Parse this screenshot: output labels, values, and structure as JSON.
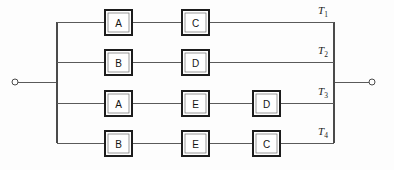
{
  "diagram": {
    "type": "block-diagram",
    "background_color": "#fdfdfd",
    "line_color": "#5a5a5a",
    "block_border_color": "#1c1c1c",
    "block_fill_color": "#ffffff",
    "terminals": {
      "left": {
        "name": "left-terminal",
        "cx": 15,
        "cy": 82,
        "r": 3
      },
      "right": {
        "name": "right-terminal",
        "cx": 372,
        "cy": 82,
        "r": 3
      }
    },
    "buses": {
      "left_x": 57,
      "right_x": 334,
      "top_y": 22,
      "bottom_y": 143
    },
    "paths": [
      {
        "id": "T1",
        "label": "T",
        "subscript": "1",
        "y": 22,
        "label_x": 318,
        "label_y": 14,
        "blocks": [
          {
            "text": "A",
            "x": 105,
            "width": 27,
            "height": 25
          },
          {
            "text": "C",
            "x": 182,
            "width": 27,
            "height": 25
          }
        ]
      },
      {
        "id": "T2",
        "label": "T",
        "subscript": "2",
        "y": 62,
        "label_x": 318,
        "label_y": 54,
        "blocks": [
          {
            "text": "B",
            "x": 105,
            "width": 27,
            "height": 25
          },
          {
            "text": "D",
            "x": 182,
            "width": 27,
            "height": 25
          }
        ]
      },
      {
        "id": "T3",
        "label": "T",
        "subscript": "3",
        "y": 103,
        "label_x": 318,
        "label_y": 95,
        "blocks": [
          {
            "text": "A",
            "x": 105,
            "width": 27,
            "height": 25
          },
          {
            "text": "E",
            "x": 182,
            "width": 27,
            "height": 25
          },
          {
            "text": "D",
            "x": 253,
            "width": 27,
            "height": 25
          }
        ]
      },
      {
        "id": "T4",
        "label": "T",
        "subscript": "4",
        "y": 143,
        "label_x": 318,
        "label_y": 135,
        "blocks": [
          {
            "text": "B",
            "x": 105,
            "width": 27,
            "height": 25
          },
          {
            "text": "E",
            "x": 182,
            "width": 27,
            "height": 25
          },
          {
            "text": "C",
            "x": 253,
            "width": 27,
            "height": 25
          }
        ]
      }
    ]
  }
}
